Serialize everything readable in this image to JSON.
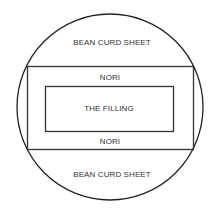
{
  "diagram": {
    "labels": {
      "top_sheet": "BEAN CURD SHEET",
      "top_nori": "NORI",
      "filling": "THE FILLING",
      "bottom_nori": "NORI",
      "bottom_sheet": "BEAN CURD SHEET"
    },
    "colors": {
      "stroke": "#222222",
      "text": "#333333",
      "background": "#ffffff"
    }
  }
}
